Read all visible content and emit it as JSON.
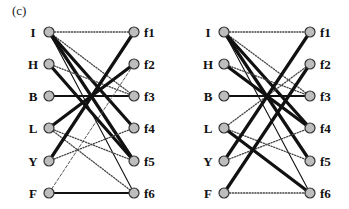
{
  "figure_label": "(c)",
  "left_nodes": [
    "I",
    "H",
    "B",
    "L",
    "Y",
    "F"
  ],
  "right_nodes": [
    "f1",
    "f2",
    "f3",
    "f4",
    "f5",
    "f6"
  ],
  "node_fill": "#bdbdbd",
  "node_stroke": "#333333",
  "edge_color": "#111111",
  "graphs": [
    {
      "name": "graph-left",
      "left_x": 49,
      "right_x": 134,
      "label_left_x": 33,
      "label_right_x": 144,
      "ys": [
        32,
        64,
        96,
        128,
        161,
        193
      ],
      "edges": [
        {
          "from": "I",
          "to": "f1",
          "style": "dotted"
        },
        {
          "from": "I",
          "to": "f3",
          "style": "dotted"
        },
        {
          "from": "I",
          "to": "f4",
          "style": "thick"
        },
        {
          "from": "I",
          "to": "f5",
          "style": "thick"
        },
        {
          "from": "I",
          "to": "f6",
          "style": "thin"
        },
        {
          "from": "H",
          "to": "f3",
          "style": "dotted"
        },
        {
          "from": "H",
          "to": "f5",
          "style": "thick"
        },
        {
          "from": "B",
          "to": "f3",
          "style": "medium"
        },
        {
          "from": "L",
          "to": "f2",
          "style": "thick"
        },
        {
          "from": "L",
          "to": "f5",
          "style": "dotted"
        },
        {
          "from": "L",
          "to": "f6",
          "style": "dotted"
        },
        {
          "from": "Y",
          "to": "f1",
          "style": "thick"
        },
        {
          "from": "Y",
          "to": "f4",
          "style": "dotted"
        },
        {
          "from": "F",
          "to": "f2",
          "style": "dashed"
        },
        {
          "from": "F",
          "to": "f6",
          "style": "medium"
        }
      ]
    },
    {
      "name": "graph-right",
      "left_x": 224,
      "right_x": 310,
      "label_left_x": 208,
      "label_right_x": 320,
      "ys": [
        32,
        64,
        96,
        128,
        161,
        193
      ],
      "edges": [
        {
          "from": "I",
          "to": "f1",
          "style": "dotted"
        },
        {
          "from": "I",
          "to": "f3",
          "style": "dotted"
        },
        {
          "from": "I",
          "to": "f4",
          "style": "thick"
        },
        {
          "from": "I",
          "to": "f5",
          "style": "thick"
        },
        {
          "from": "I",
          "to": "f6",
          "style": "thin"
        },
        {
          "from": "H",
          "to": "f3",
          "style": "dotted"
        },
        {
          "from": "H",
          "to": "f4",
          "style": "thick"
        },
        {
          "from": "B",
          "to": "f3",
          "style": "medium"
        },
        {
          "from": "L",
          "to": "f2",
          "style": "dotted"
        },
        {
          "from": "L",
          "to": "f5",
          "style": "dotted"
        },
        {
          "from": "L",
          "to": "f6",
          "style": "thick"
        },
        {
          "from": "Y",
          "to": "f1",
          "style": "thick"
        },
        {
          "from": "Y",
          "to": "f4",
          "style": "dotted"
        },
        {
          "from": "F",
          "to": "f2",
          "style": "thick"
        },
        {
          "from": "F",
          "to": "f6",
          "style": "dotted"
        }
      ]
    }
  ]
}
